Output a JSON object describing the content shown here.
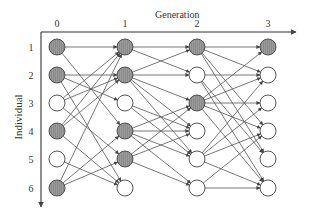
{
  "title": "Generation",
  "y_axis_label": "Individual",
  "colors": {
    "shaded_fill": "#8a8a8a",
    "empty_fill": "#ffffff",
    "stroke": "#444444",
    "edge": "#555555",
    "axis": "#333333"
  },
  "generations": [
    {
      "label": "0",
      "x": 57
    },
    {
      "label": "1",
      "x": 125
    },
    {
      "label": "2",
      "x": 197
    },
    {
      "label": "3",
      "x": 268
    }
  ],
  "individuals": [
    {
      "label": "1",
      "y": 47
    },
    {
      "label": "2",
      "y": 75
    },
    {
      "label": "3",
      "y": 103
    },
    {
      "label": "4",
      "y": 131
    },
    {
      "label": "5",
      "y": 159
    },
    {
      "label": "6",
      "y": 188
    }
  ],
  "nodes": [
    [
      true,
      true,
      false,
      true,
      false,
      true
    ],
    [
      true,
      true,
      false,
      true,
      true,
      false
    ],
    [
      true,
      false,
      true,
      false,
      false,
      false
    ],
    [
      true,
      false,
      false,
      false,
      false,
      false
    ]
  ],
  "edges": [
    [
      [
        0,
        0
      ],
      [
        1,
        0
      ]
    ],
    [
      [
        0,
        0
      ],
      [
        1,
        3
      ]
    ],
    [
      [
        0,
        1
      ],
      [
        1,
        1
      ]
    ],
    [
      [
        0,
        1
      ],
      [
        1,
        2
      ]
    ],
    [
      [
        0,
        1
      ],
      [
        1,
        5
      ]
    ],
    [
      [
        0,
        2
      ],
      [
        1,
        0
      ]
    ],
    [
      [
        0,
        2
      ],
      [
        1,
        1
      ]
    ],
    [
      [
        0,
        2
      ],
      [
        1,
        4
      ]
    ],
    [
      [
        0,
        3
      ],
      [
        1,
        0
      ]
    ],
    [
      [
        0,
        3
      ],
      [
        1,
        1
      ]
    ],
    [
      [
        0,
        3
      ],
      [
        1,
        5
      ]
    ],
    [
      [
        0,
        4
      ],
      [
        1,
        5
      ]
    ],
    [
      [
        0,
        5
      ],
      [
        1,
        0
      ]
    ],
    [
      [
        0,
        5
      ],
      [
        1,
        3
      ]
    ],
    [
      [
        0,
        5
      ],
      [
        1,
        4
      ]
    ],
    [
      [
        1,
        0
      ],
      [
        2,
        0
      ]
    ],
    [
      [
        1,
        0
      ],
      [
        2,
        1
      ]
    ],
    [
      [
        1,
        1
      ],
      [
        2,
        0
      ]
    ],
    [
      [
        1,
        1
      ],
      [
        2,
        1
      ]
    ],
    [
      [
        1,
        1
      ],
      [
        2,
        2
      ]
    ],
    [
      [
        1,
        1
      ],
      [
        2,
        3
      ]
    ],
    [
      [
        1,
        1
      ],
      [
        2,
        4
      ]
    ],
    [
      [
        1,
        2
      ],
      [
        2,
        3
      ]
    ],
    [
      [
        1,
        2
      ],
      [
        2,
        4
      ]
    ],
    [
      [
        1,
        3
      ],
      [
        2,
        2
      ]
    ],
    [
      [
        1,
        3
      ],
      [
        2,
        3
      ]
    ],
    [
      [
        1,
        3
      ],
      [
        2,
        4
      ]
    ],
    [
      [
        1,
        3
      ],
      [
        2,
        5
      ]
    ],
    [
      [
        1,
        4
      ],
      [
        2,
        2
      ]
    ],
    [
      [
        1,
        4
      ],
      [
        2,
        3
      ]
    ],
    [
      [
        1,
        4
      ],
      [
        2,
        5
      ]
    ],
    [
      [
        2,
        0
      ],
      [
        3,
        0
      ]
    ],
    [
      [
        2,
        0
      ],
      [
        3,
        1
      ]
    ],
    [
      [
        2,
        0
      ],
      [
        3,
        3
      ]
    ],
    [
      [
        2,
        0
      ],
      [
        3,
        4
      ]
    ],
    [
      [
        2,
        1
      ],
      [
        3,
        1
      ]
    ],
    [
      [
        2,
        1
      ],
      [
        3,
        4
      ]
    ],
    [
      [
        2,
        1
      ],
      [
        3,
        5
      ]
    ],
    [
      [
        2,
        2
      ],
      [
        3,
        0
      ]
    ],
    [
      [
        2,
        2
      ],
      [
        3,
        1
      ]
    ],
    [
      [
        2,
        2
      ],
      [
        3,
        2
      ]
    ],
    [
      [
        2,
        2
      ],
      [
        3,
        3
      ]
    ],
    [
      [
        2,
        2
      ],
      [
        3,
        5
      ]
    ],
    [
      [
        2,
        4
      ],
      [
        3,
        1
      ]
    ],
    [
      [
        2,
        4
      ],
      [
        3,
        2
      ]
    ],
    [
      [
        2,
        4
      ],
      [
        3,
        3
      ]
    ],
    [
      [
        2,
        4
      ],
      [
        3,
        5
      ]
    ],
    [
      [
        2,
        5
      ],
      [
        3,
        3
      ]
    ],
    [
      [
        2,
        5
      ],
      [
        3,
        5
      ]
    ]
  ]
}
